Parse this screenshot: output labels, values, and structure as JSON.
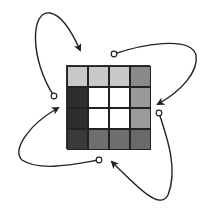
{
  "diagram": {
    "grid": {
      "rows": 4,
      "cols": 4,
      "cells": [
        [
          "#c8c8c8",
          "#c8c8c8",
          "#c8c8c8",
          "#8a8a8a"
        ],
        [
          "#2e2e2e",
          "#ffffff",
          "#ffffff",
          "#999999"
        ],
        [
          "#2e2e2e",
          "#ffffff",
          "#ffffff",
          "#9a9a9a"
        ],
        [
          "#3a3a3a",
          "#6e6e6e",
          "#6e6e6e",
          "#6a6a6a"
        ]
      ]
    },
    "arrows": [
      {
        "name": "top-left-loop",
        "start_marker": "open-circle",
        "end_marker": "arrowhead",
        "path": "M54,96 C30,60 30,10 50,13 C62,15 72,32 80,50"
      },
      {
        "name": "top-right-loop",
        "start_marker": "open-circle",
        "end_marker": "arrowhead",
        "path": "M114,54 C140,45 190,35 196,55 C199,72 180,92 158,104"
      },
      {
        "name": "bottom-right-loop",
        "start_marker": "open-circle",
        "end_marker": "arrowhead",
        "path": "M159,113 C168,140 178,170 168,195 C160,210 140,190 112,162"
      },
      {
        "name": "bottom-left-loop",
        "start_marker": "open-circle",
        "end_marker": "arrowhead",
        "path": "M99,160 C75,164 40,172 22,160 C12,150 28,125 58,108"
      }
    ],
    "stroke_color": "#222222"
  }
}
